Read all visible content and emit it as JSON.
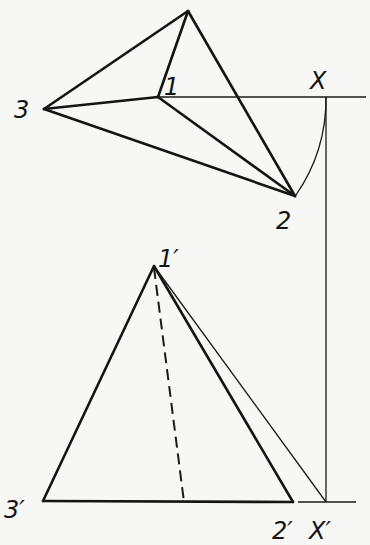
{
  "figure": {
    "type": "descriptive-geometry projection",
    "background": "#f7f7f5",
    "line_color": "#141414",
    "top_view": {
      "points": {
        "apex": {
          "x": 188,
          "y": 11
        },
        "p1": {
          "x": 158,
          "y": 97,
          "label": "1"
        },
        "p2": {
          "x": 295,
          "y": 196,
          "label": "2"
        },
        "p3": {
          "x": 44,
          "y": 109,
          "label": "3"
        },
        "X": {
          "x": 326,
          "y": 97,
          "label": "X"
        }
      },
      "reference_line": {
        "x1": 158,
        "y1": 97,
        "x2": 366,
        "y2": 97
      },
      "arc": {
        "center": "p1",
        "from": "X",
        "to": "p2",
        "radius": 170
      }
    },
    "front_view": {
      "points": {
        "p1p": {
          "x": 154,
          "y": 266,
          "label": "1'"
        },
        "p2p": {
          "x": 293,
          "y": 502,
          "label": "2'"
        },
        "p3p": {
          "x": 43,
          "y": 501,
          "label": "3'"
        },
        "Xp": {
          "x": 326,
          "y": 502,
          "label": "X'"
        },
        "dash_foot": {
          "x": 184,
          "y": 502
        }
      },
      "baseline_extension": {
        "x1": 298,
        "y1": 502,
        "x2": 356,
        "y2": 502
      }
    },
    "projector": {
      "x": 326,
      "y1": 97,
      "y2": 502
    }
  },
  "labels": {
    "l1": "1",
    "l2": "2",
    "l3": "3",
    "lx": "X",
    "l1p": "1′",
    "l2p": "2′",
    "l3p": "3′",
    "lxp": "X′"
  }
}
